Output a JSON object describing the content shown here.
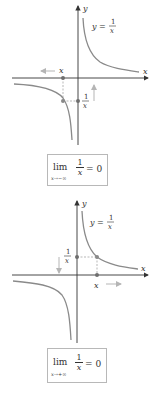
{
  "colors": {
    "axis": "#333333",
    "curve": "#8a8a8a",
    "point": "#6e6e6e",
    "arrow_light": "#b5b5b5",
    "box_border": "#b8b8b8"
  },
  "top_graph": {
    "axis_label_y": "y",
    "axis_label_x": "x",
    "function_label": "y =",
    "function_num": "1",
    "function_den": "x",
    "point_label_x": "x",
    "point_label_num": "1",
    "point_label_den": "x",
    "direction_arrow": "left-arrow-icon",
    "limit": {
      "word": "lim",
      "subscript": "x→−∞",
      "num": "1",
      "den": "x",
      "equals": "= 0"
    }
  },
  "bottom_graph": {
    "axis_label_y": "y",
    "axis_label_x": "x",
    "function_label": "y =",
    "function_num": "1",
    "function_den": "x",
    "point_label_x": "x",
    "point_label_num": "1",
    "point_label_den": "x",
    "direction_arrow": "right-arrow-icon",
    "limit": {
      "word": "lim",
      "subscript": "x→+∞",
      "num": "1",
      "den": "x",
      "equals": "= 0"
    }
  }
}
